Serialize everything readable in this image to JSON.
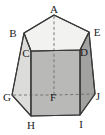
{
  "figure": {
    "name": "pentagonal-prism",
    "background_color": "#ffffff"
  },
  "colors": {
    "edge_stroke": "#3a3a3a",
    "hidden_edge_stroke": "#6e6e6e",
    "top_face_fill": "#f2f2f0",
    "left_face_fill": "#dcdcda",
    "front_face_fill": "#b9b9b7",
    "right_face_fill": "#a2a2a0",
    "label_color": "#1a1a1a"
  },
  "vertices": [
    {
      "id": "A",
      "label": "A",
      "x": 54,
      "y": 15,
      "lx": 54,
      "ly": 13
    },
    {
      "id": "B",
      "label": "B",
      "x": 24,
      "y": 33,
      "lx": 13,
      "ly": 37
    },
    {
      "id": "E",
      "label": "E",
      "x": 89,
      "y": 32,
      "lx": 97,
      "ly": 36
    },
    {
      "id": "C",
      "label": "C",
      "x": 31,
      "y": 51,
      "lx": 26,
      "ly": 56
    },
    {
      "id": "D",
      "label": "D",
      "x": 80,
      "y": 50,
      "lx": 83,
      "ly": 55
    },
    {
      "id": "F",
      "label": "F",
      "x": 54,
      "y": 95,
      "lx": 52,
      "ly": 100
    },
    {
      "id": "G",
      "label": "G",
      "x": 12,
      "y": 95,
      "lx": 8,
      "ly": 100
    },
    {
      "id": "J",
      "label": "J",
      "x": 95,
      "y": 94,
      "lx": 96,
      "ly": 99
    },
    {
      "id": "H",
      "label": "H",
      "x": 31,
      "y": 116,
      "lx": 31,
      "ly": 128
    },
    {
      "id": "I",
      "label": "I",
      "x": 80,
      "y": 115,
      "lx": 81,
      "ly": 127
    }
  ],
  "faces": [
    {
      "name": "top-face",
      "vertices": "A,B,C,D,E",
      "shade": "lightest"
    },
    {
      "name": "left-face",
      "vertices": "B,C,H,G",
      "shade": "light"
    },
    {
      "name": "front-face",
      "vertices": "C,D,I,H",
      "shade": "medium"
    },
    {
      "name": "right-face",
      "vertices": "D,E,J,I",
      "shade": "dark"
    }
  ],
  "edges": {
    "solid": [
      "A-B",
      "B-C",
      "C-D",
      "D-E",
      "E-A",
      "B-G",
      "C-H",
      "D-I",
      "E-J",
      "G-H",
      "H-I",
      "I-J"
    ],
    "hidden_dashed": [
      "A-F",
      "F-G",
      "F-J"
    ]
  },
  "labels": {
    "A": "A",
    "B": "B",
    "C": "C",
    "D": "D",
    "E": "E",
    "F": "F",
    "G": "G",
    "H": "H",
    "I": "I",
    "J": "J"
  }
}
